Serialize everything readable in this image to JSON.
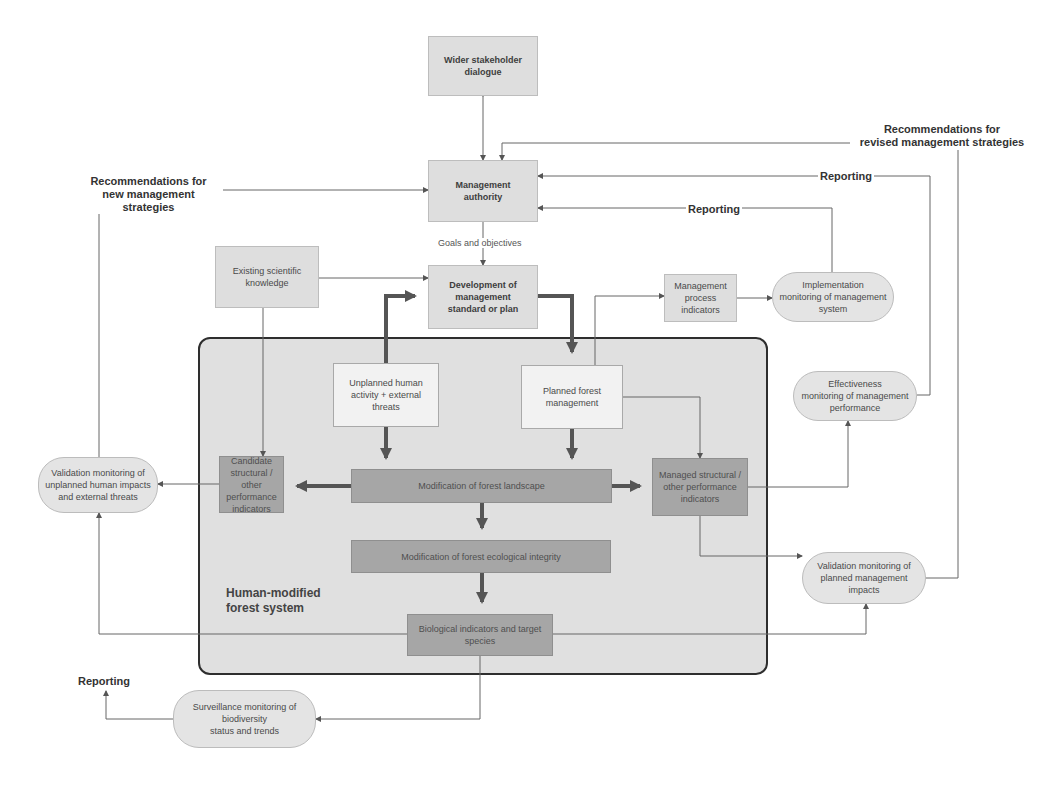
{
  "diagram": {
    "system_container": {
      "label": "Human-modified\nforest system"
    },
    "nodes": {
      "wider_stakeholder": "Wider stakeholder\ndialogue",
      "management_authority": "Management\nauthority",
      "existing_knowledge": "Existing scientific\nknowledge",
      "development_plan": "Development of\nmanagement\nstandard or plan",
      "process_indicators": "Management\nprocess\nindicators",
      "implementation_monitoring": "Implementation\nmonitoring of management\nsystem",
      "unplanned_activity": "Unplanned human\nactivity + external\nthreats",
      "planned_management": "Planned forest\nmanagement",
      "effectiveness_monitoring": "Effectiveness\nmonitoring of management\nperformance",
      "validation_unplanned": "Validation monitoring of\nunplanned human impacts\nand external threats",
      "candidate_indicators": "Candidate\nstructural / other\nperformance\nindicators",
      "modification_landscape": "Modification of forest landscape",
      "managed_indicators": "Managed structural /\nother performance\nindicators",
      "modification_integrity": "Modification of forest ecological integrity",
      "validation_planned": "Validation monitoring of\nplanned management\nimpacts",
      "biological_indicators": "Biological indicators and target\nspecies",
      "surveillance_monitoring": "Surveillance monitoring of\nbiodiversity\nstatus and trends"
    },
    "labels": {
      "rec_new": "Recommendations for\nnew management strategies",
      "rec_revised": "Recommendations for\nrevised management strategies",
      "reporting_top": "Reporting",
      "reporting_mid": "Reporting",
      "reporting_bottom": "Reporting",
      "goals": "Goals and objectives"
    },
    "colors": {
      "light_box": "#dedede",
      "dark_box": "#a6a6a6",
      "container": "#e0e0e0",
      "thick_arrow": "#555555",
      "thin_line": "#666666"
    }
  }
}
